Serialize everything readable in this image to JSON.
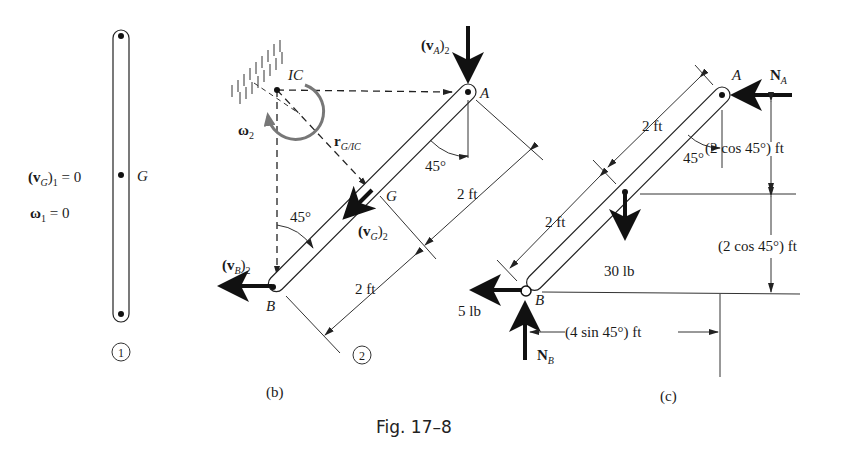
{
  "figure": {
    "caption": "Fig. 17–8"
  },
  "panel1": {
    "label": "1",
    "vG_main": "(v",
    "vG_sub": "G",
    "vG_close": ")",
    "vG_index": "1",
    "vG_value": " = 0",
    "omega_main": "ω",
    "omega_index": "1",
    "omega_value": " = 0",
    "point_G": "G"
  },
  "panelB": {
    "label": "(b)",
    "position_label": "2",
    "IC": "IC",
    "omega": "ω",
    "omega_index": "2",
    "vA_main": "(v",
    "vA_sub": "A",
    "vA_close": ")",
    "vA_index": "2",
    "vB_main": "(v",
    "vB_sub": "B",
    "vB_close": ")",
    "vB_index": "2",
    "vG_main": "(v",
    "vG_sub": "G",
    "vG_close": ")",
    "vG_index": "2",
    "r_main": "r",
    "r_sub": "G/IC",
    "point_A": "A",
    "point_B": "B",
    "point_G": "G",
    "angle_top": "45°",
    "angle_bottom": "45°",
    "dim_upper": "2 ft",
    "dim_lower": "2 ft"
  },
  "panelC": {
    "label": "(c)",
    "point_A": "A",
    "point_B": "B",
    "NA_main": "N",
    "NA_sub": "A",
    "NB_main": "N",
    "NB_sub": "B",
    "weight": "30 lb",
    "friction": "5 lb",
    "angle": "45°",
    "dim_upper": "2 ft",
    "dim_lower": "2 ft",
    "dim_vert_upper": "(2 cos 45°) ft",
    "dim_vert_lower": "(2 cos 45°) ft",
    "dim_horiz": "(4 sin 45°) ft"
  }
}
